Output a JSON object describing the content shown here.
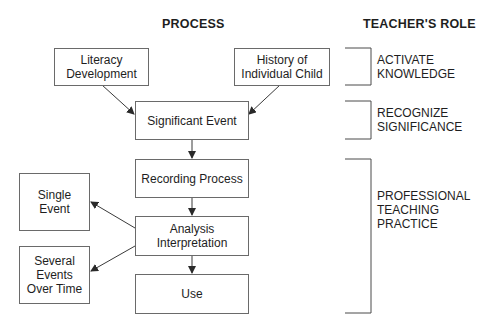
{
  "headers": {
    "process": "PROCESS",
    "teachers_role": "TEACHER'S ROLE"
  },
  "process_boxes": {
    "literacy_development": "Literacy\nDevelopment",
    "history_of_child": "History of\nIndividual Child",
    "significant_event": "Significant Event",
    "recording_process": "Recording Process",
    "analysis_interpretation": "Analysis\nInterpretation",
    "use": "Use"
  },
  "outcome_boxes": {
    "single_event": "Single\nEvent",
    "several_events": "Several\nEvents\nOver Time"
  },
  "roles": [
    {
      "label": "ACTIVATE\nKNOWLEDGE"
    },
    {
      "label": "RECOGNIZE\nSIGNIFICANCE"
    },
    {
      "label": "PROFESSIONAL\nTEACHING\nPRACTICE"
    }
  ],
  "colors": {
    "line": "#3a3a3a",
    "border": "#6a6a6a",
    "text": "#1e1e1e"
  }
}
